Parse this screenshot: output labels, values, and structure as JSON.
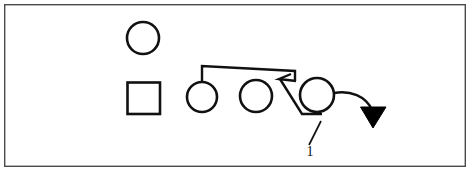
{
  "figure": {
    "width": 471,
    "height": 178,
    "background_color": "#ffffff",
    "ink_color": "#111111",
    "frame_color": "#4b4b4b",
    "frame": {
      "x": 4,
      "y": 4,
      "width": 462,
      "height": 163
    },
    "callouts": [
      {
        "id": "callout-1",
        "label": "1",
        "x": 310,
        "y": 155
      }
    ],
    "shapes": [
      {
        "name": "legend-circle",
        "type": "circle",
        "cx": 143,
        "cy": 38,
        "r": 16
      },
      {
        "name": "legend-square",
        "type": "square",
        "x": 127,
        "y": 82,
        "width": 33,
        "height": 32
      },
      {
        "name": "node-circle-left",
        "type": "circle",
        "cx": 202,
        "cy": 97,
        "r": 15
      },
      {
        "name": "node-circle-middle",
        "type": "circle",
        "cx": 256,
        "cy": 96,
        "r": 16
      },
      {
        "name": "node-circle-right",
        "type": "circle",
        "cx": 317,
        "cy": 95,
        "r": 17
      }
    ],
    "connectors": [
      {
        "name": "top-bracket-link",
        "points": "202,82 202,66 295,71 295,80"
      },
      {
        "name": "pointer-diagonal",
        "points": "289,75 280,78 296,80"
      },
      {
        "name": "lower-diagonal",
        "points": "281,78 302,113 321,113"
      },
      {
        "name": "callout-leader",
        "points": "310,146 320,122"
      },
      {
        "name": "exit-curve",
        "points": "334,93 352,92 366,99 372,112"
      }
    ],
    "arrowhead": {
      "name": "down-arrow-head",
      "points": "361,107 386,107 373,128"
    }
  }
}
